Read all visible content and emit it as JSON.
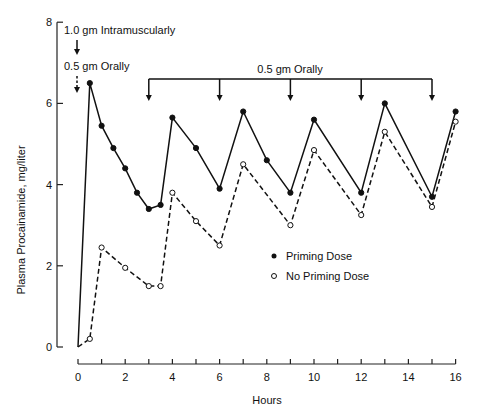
{
  "chart_data": {
    "type": "line",
    "title": "",
    "xlabel": "Hours",
    "ylabel": "Plasma Procainamide, mg/liter",
    "xlim": [
      0,
      16
    ],
    "ylim": [
      0,
      8
    ],
    "x_ticks": [
      0,
      2,
      4,
      6,
      8,
      10,
      12,
      14,
      16
    ],
    "y_ticks": [
      0,
      2,
      4,
      6,
      8
    ],
    "grid": false,
    "legend_position": "lower-right inside",
    "series": [
      {
        "name": "Priming Dose",
        "marker": "filled-circle",
        "line": "solid",
        "x": [
          0,
          0.5,
          1,
          1.5,
          2,
          2.5,
          3,
          3.5,
          4,
          5,
          6,
          7,
          8,
          9,
          10,
          12,
          13,
          15,
          16
        ],
        "values": [
          0,
          6.5,
          5.45,
          4.9,
          4.4,
          3.8,
          3.4,
          3.5,
          5.65,
          4.9,
          3.9,
          5.8,
          4.6,
          3.8,
          5.6,
          3.8,
          6.0,
          3.7,
          5.8
        ]
      },
      {
        "name": "No Priming Dose",
        "marker": "open-circle",
        "line": "dashed",
        "x": [
          0,
          0.5,
          1,
          2,
          3,
          3.5,
          4,
          5,
          6,
          7,
          9,
          10,
          12,
          13,
          15,
          16
        ],
        "values": [
          0,
          0.2,
          2.45,
          1.95,
          1.5,
          1.5,
          3.8,
          3.1,
          2.5,
          4.5,
          3.0,
          4.85,
          3.25,
          5.3,
          3.45,
          5.55
        ]
      }
    ],
    "annotations": [
      {
        "text": "1.0 gm Intramuscularly",
        "x": 0,
        "arrow": "solid"
      },
      {
        "text": "0.5 gm Orally",
        "x": 0,
        "arrow": "dashed"
      },
      {
        "text": "0.5 gm Orally",
        "x_doses": [
          3,
          6,
          9,
          12,
          15
        ],
        "arrow": "solid"
      }
    ]
  },
  "labels": {
    "xlabel": "Hours",
    "ylabel": "Plasma Procainamide, mg/liter",
    "im_dose": "1.0 gm Intramuscularly",
    "oral_initial": "0.5 gm Orally",
    "oral_repeat": "0.5 gm Orally",
    "legend_priming": "Priming Dose",
    "legend_no_priming": "No Priming Dose"
  }
}
